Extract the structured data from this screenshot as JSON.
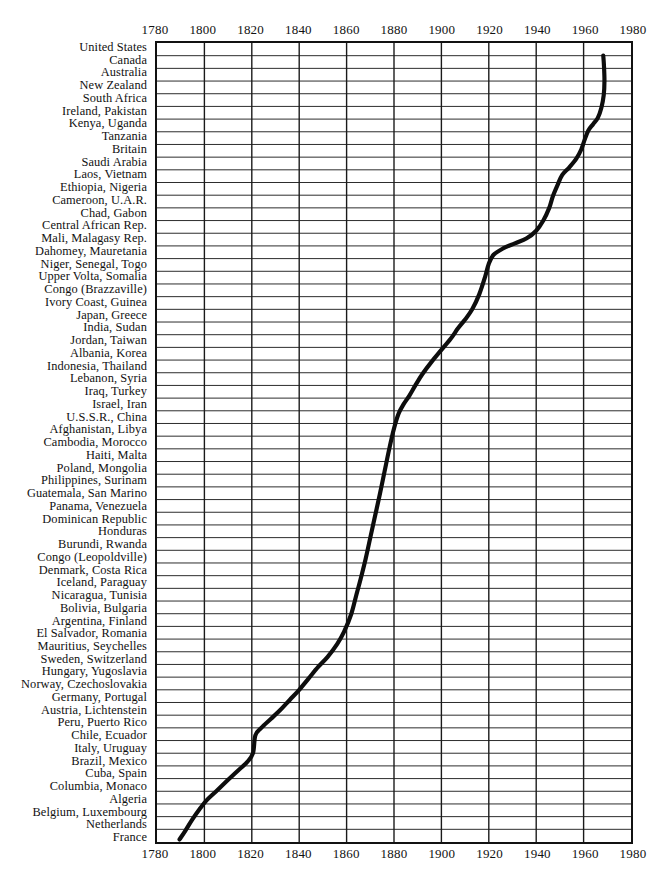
{
  "chart_data": {
    "type": "line",
    "title": "",
    "xlabel": "",
    "ylabel": "",
    "xlim": [
      1780,
      1980
    ],
    "ylim": [
      0,
      57
    ],
    "grid": true,
    "legend": false,
    "x_ticks": [
      1780,
      1800,
      1820,
      1840,
      1860,
      1880,
      1900,
      1920,
      1940,
      1960,
      1980
    ],
    "x_tick_labels": [
      "1780",
      "1800",
      "1820",
      "1840",
      "1860",
      "1880",
      "1900",
      "1920",
      "1940",
      "1960",
      "1980"
    ],
    "categories": [
      "United States",
      "Canada",
      "Australia",
      "New Zealand",
      "South Africa",
      "Ireland, Pakistan",
      "Kenya, Uganda",
      "Tanzania",
      "Britain",
      "Saudi Arabia",
      "Laos, Vietnam",
      "Ethiopia, Nigeria",
      "Cameroon, U.A.R.",
      "Chad, Gabon",
      "Central African Rep.",
      "Mali, Malagasy Rep.",
      "Dahomey, Mauretania",
      "Niger, Senegal, Togo",
      "Upper Volta, Somalia",
      "Congo (Brazzaville)",
      "Ivory Coast, Guinea",
      "Japan, Greece",
      "India, Sudan",
      "Jordan, Taiwan",
      "Albania, Korea",
      "Indonesia, Thailand",
      "Lebanon, Syria",
      "Iraq, Turkey",
      "Israel, Iran",
      "U.S.S.R., China",
      "Afghanistan, Libya",
      "Cambodia, Morocco",
      "Haiti, Malta",
      "Poland, Mongolia",
      "Philippines, Surinam",
      "Guatemala, San Marino",
      "Panama, Venezuela",
      "Dominican Republic",
      "Honduras",
      "Burundi, Rwanda",
      "Congo (Leopoldville)",
      "Denmark, Costa Rica",
      "Iceland, Paraguay",
      "Nicaragua, Tunisia",
      "Bolivia, Bulgaria",
      "Argentina, Finland",
      "El Salvador, Romania",
      "Mauritius, Seychelles",
      "Sweden, Switzerland",
      "Hungary, Yugoslavia",
      "Norway, Czechoslovakia",
      "Germany, Portugal",
      "Austria, Lichtenstein",
      "Peru, Puerto Rico",
      "Chile, Ecuador",
      "Italy, Uruguay",
      "Brazil, Mexico",
      "Cuba, Spain",
      "Columbia, Monaco",
      "Algeria",
      "Belgium, Luxembourg",
      "Netherlands",
      "France"
    ],
    "series": [
      {
        "name": "cumulative adoption",
        "points": [
          [
            1789.5,
            0.2
          ],
          [
            1792.0,
            0.9
          ],
          [
            1795.0,
            1.8
          ],
          [
            1798.0,
            2.6
          ],
          [
            1801.0,
            3.3
          ],
          [
            1805.0,
            4.0
          ],
          [
            1810.0,
            4.9
          ],
          [
            1814.0,
            5.6
          ],
          [
            1818.0,
            6.3
          ],
          [
            1820.5,
            7.0
          ],
          [
            1821.5,
            8.4
          ],
          [
            1824.0,
            9.0
          ],
          [
            1828.0,
            9.7
          ],
          [
            1832.0,
            10.4
          ],
          [
            1836.0,
            11.2
          ],
          [
            1840.0,
            12.0
          ],
          [
            1844.0,
            12.9
          ],
          [
            1848.0,
            13.8
          ],
          [
            1852.0,
            14.6
          ],
          [
            1856.0,
            15.6
          ],
          [
            1859.0,
            16.6
          ],
          [
            1862.0,
            18.0
          ],
          [
            1864.0,
            19.4
          ],
          [
            1866.0,
            20.8
          ],
          [
            1868.0,
            22.3
          ],
          [
            1870.0,
            24.0
          ],
          [
            1872.0,
            25.7
          ],
          [
            1874.0,
            27.4
          ],
          [
            1876.0,
            29.2
          ],
          [
            1878.0,
            31.0
          ],
          [
            1880.0,
            32.6
          ],
          [
            1882.0,
            33.8
          ],
          [
            1884.0,
            34.5
          ],
          [
            1886.5,
            35.2
          ],
          [
            1889.0,
            36.0
          ],
          [
            1892.0,
            36.9
          ],
          [
            1896.0,
            37.9
          ],
          [
            1900.0,
            38.8
          ],
          [
            1904.0,
            39.7
          ],
          [
            1907.0,
            40.5
          ],
          [
            1910.0,
            41.2
          ],
          [
            1913.0,
            42.0
          ],
          [
            1916.0,
            43.2
          ],
          [
            1918.5,
            44.6
          ],
          [
            1920.0,
            45.6
          ],
          [
            1922.0,
            46.3
          ],
          [
            1926.0,
            46.8
          ],
          [
            1931.0,
            47.2
          ],
          [
            1936.0,
            47.6
          ],
          [
            1940.0,
            48.2
          ],
          [
            1943.0,
            49.0
          ],
          [
            1945.5,
            50.0
          ],
          [
            1947.0,
            50.9
          ],
          [
            1949.0,
            51.8
          ],
          [
            1951.0,
            52.6
          ],
          [
            1954.0,
            53.2
          ],
          [
            1957.0,
            53.9
          ],
          [
            1959.0,
            54.6
          ],
          [
            1960.5,
            55.4
          ],
          [
            1962.0,
            56.1
          ],
          [
            1964.0,
            56.6
          ],
          [
            1966.0,
            57.1
          ],
          [
            1967.5,
            57.9
          ],
          [
            1968.5,
            58.9
          ],
          [
            1968.8,
            60.0
          ],
          [
            1968.6,
            61.2
          ],
          [
            1968.3,
            62.0
          ]
        ]
      }
    ]
  },
  "axis": {
    "top_labels": [
      "1780",
      "1800",
      "1820",
      "1840",
      "1860",
      "1880",
      "1900",
      "1920",
      "1940",
      "1960",
      "1980"
    ],
    "bottom_labels": [
      "1780",
      "1800",
      "1820",
      "1840",
      "1860",
      "1880",
      "1900",
      "1920",
      "1940",
      "1960",
      "1980"
    ]
  },
  "colors": {
    "curve": "#0d0d0d",
    "grid_horizontal": "#2b2b2b",
    "grid_vertical": "#1a1a1a",
    "frame": "#111111",
    "background": "#ffffff"
  }
}
